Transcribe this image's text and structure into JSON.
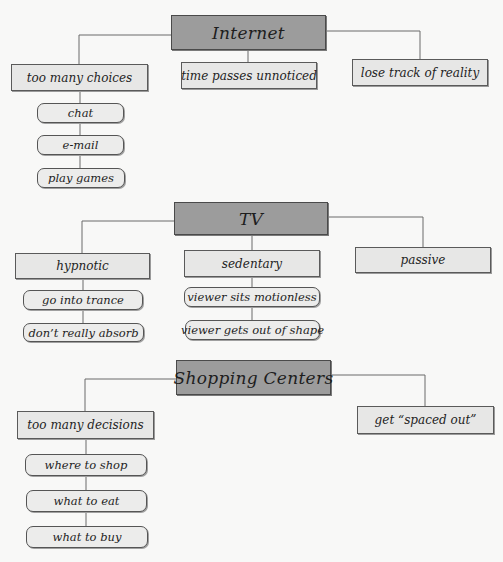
{
  "diagram": {
    "type": "concept-map",
    "colors": {
      "root_fill": "#9c9c9c",
      "branch_fill": "#e7e7e6",
      "leaf_fill": "#ececeb",
      "line": "#6a6a6a",
      "background": "#f8f8f7"
    },
    "groups": [
      {
        "root": "Internet",
        "branches": [
          {
            "label": "too many choices",
            "children": [
              "chat",
              "e-mail",
              "play games"
            ]
          },
          {
            "label": "time passes unnoticed",
            "children": []
          },
          {
            "label": "lose track of reality",
            "children": []
          }
        ]
      },
      {
        "root": "TV",
        "branches": [
          {
            "label": "hypnotic",
            "children": [
              "go into trance",
              "don’t really absorb"
            ]
          },
          {
            "label": "sedentary",
            "children": [
              "viewer sits motionless",
              "viewer gets out of shape"
            ]
          },
          {
            "label": "passive",
            "children": []
          }
        ]
      },
      {
        "root": "Shopping Centers",
        "branches": [
          {
            "label": "too many decisions",
            "children": [
              "where to shop",
              "what to eat",
              "what to buy"
            ]
          },
          {
            "label": "get “spaced out”",
            "children": []
          }
        ]
      }
    ]
  }
}
